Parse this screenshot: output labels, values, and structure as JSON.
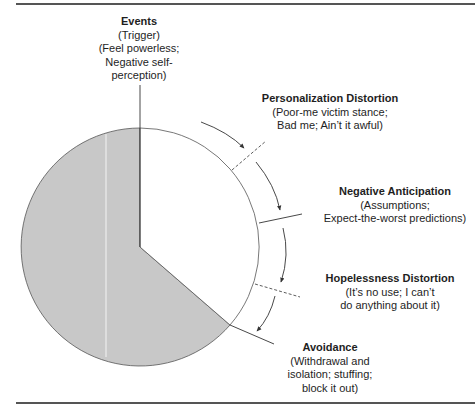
{
  "diagram": {
    "type": "cycle-pie",
    "fill_color": "#c8c8c8",
    "line_color": "#333333",
    "stages": [
      {
        "title": "Events",
        "desc": [
          "(Trigger)",
          "(Feel powerless;",
          "Negative self-",
          "perception)"
        ]
      },
      {
        "title": "Personalization Distortion",
        "desc": [
          "(Poor-me victim stance;",
          "Bad me; Ain’t it awful)"
        ]
      },
      {
        "title": "Negative Anticipation",
        "desc": [
          "(Assumptions;",
          "Expect-the-worst predictions)"
        ]
      },
      {
        "title": "Hopelessness Distortion",
        "desc": [
          "(It’s no use; I can’t",
          "do anything about it)"
        ]
      },
      {
        "title": "Avoidance",
        "desc": [
          "(Withdrawal and",
          "isolation; stuffing;",
          "block it out)"
        ]
      }
    ]
  }
}
